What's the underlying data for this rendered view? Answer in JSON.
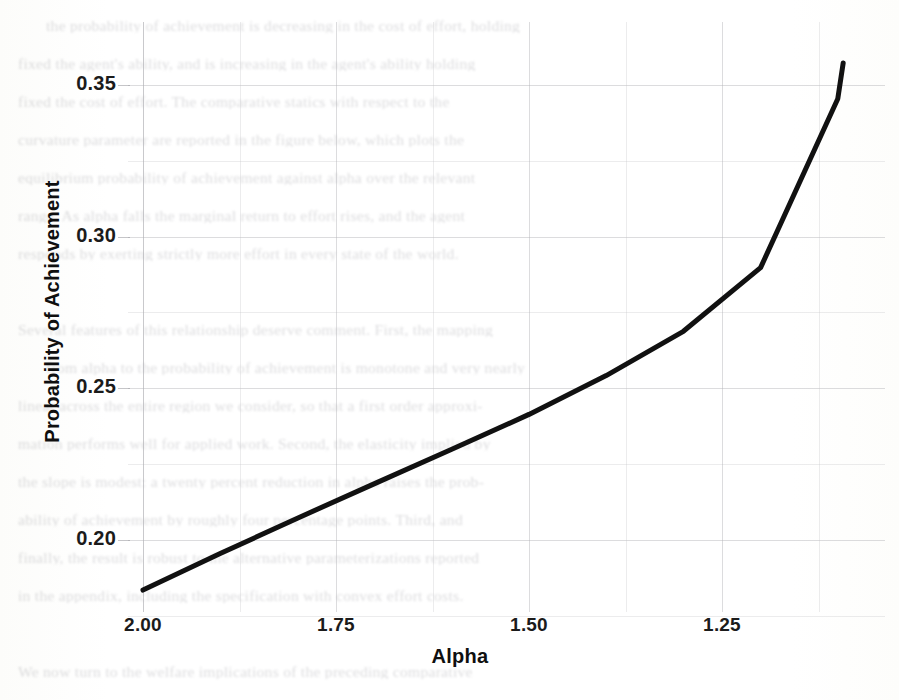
{
  "page": {
    "width": 899,
    "height": 700,
    "background_color": "#ffffff",
    "kind": "scanned-page-with-figure"
  },
  "ghost_text": {
    "description": "faint illegible bleed-through body text from reverse side of scanned page",
    "lines": [
      "the probability of achievement is decreasing in the cost of effort, holding",
      "fixed the agent's ability, and is increasing in the agent's ability holding",
      "fixed the cost of effort. The comparative statics with respect to the",
      "curvature parameter are reported in the figure below, which plots the",
      "equilibrium probability of achievement against alpha over the relevant",
      "range. As alpha falls the marginal return to effort rises, and the agent",
      "responds by exerting strictly more effort in every state of the world.",
      "",
      "Several features of this relationship deserve comment. First, the mapping",
      "from alpha to the probability of achievement is monotone and very nearly",
      "linear across the entire region we consider, so that a first order approxi-",
      "mation performs well for applied work. Second, the elasticity implied by",
      "the slope is modest: a twenty percent reduction in alpha raises the prob-",
      "ability of achievement by roughly four percentage points. Third, and",
      "finally, the result is robust to the alternative parameterizations reported",
      "in the appendix, including the specification with convex effort costs.",
      "",
      "We now turn to the welfare implications of the preceding comparative"
    ]
  },
  "chart_data": {
    "type": "line",
    "title": "",
    "xlabel": "Alpha",
    "ylabel": "Probability of Achievement",
    "xlim": [
      2.06,
      1.07
    ],
    "ylim": [
      0.1818,
      0.3593
    ],
    "x_ticks": [
      "2.00",
      "1.75",
      "1.50",
      "1.25"
    ],
    "x_tick_values": [
      2.0,
      1.75,
      1.5,
      1.25
    ],
    "y_ticks": [
      "0.35",
      "0.30",
      "0.25",
      "0.20"
    ],
    "y_tick_values": [
      0.35,
      0.3,
      0.25,
      0.2
    ],
    "x_axis_reversed": true,
    "grid": true,
    "minor_grid": true,
    "legend": "none",
    "line_color": "#111111",
    "line_width": 5,
    "x": [
      2.0,
      1.9,
      1.8,
      1.7,
      1.6,
      1.5,
      1.4,
      1.3,
      1.2,
      1.1,
      1.093
    ],
    "values": [
      0.1835,
      0.1955,
      0.2072,
      0.2186,
      0.2299,
      0.2414,
      0.2542,
      0.2688,
      0.2898,
      0.3455,
      0.3573
    ],
    "series": [
      {
        "name": "Probability of Achievement",
        "x": [
          2.0,
          1.9,
          1.8,
          1.7,
          1.6,
          1.5,
          1.4,
          1.3,
          1.2,
          1.1,
          1.093
        ],
        "values": [
          0.1835,
          0.1955,
          0.2072,
          0.2186,
          0.2299,
          0.2414,
          0.2542,
          0.2688,
          0.2898,
          0.3455,
          0.3573
        ]
      }
    ]
  }
}
